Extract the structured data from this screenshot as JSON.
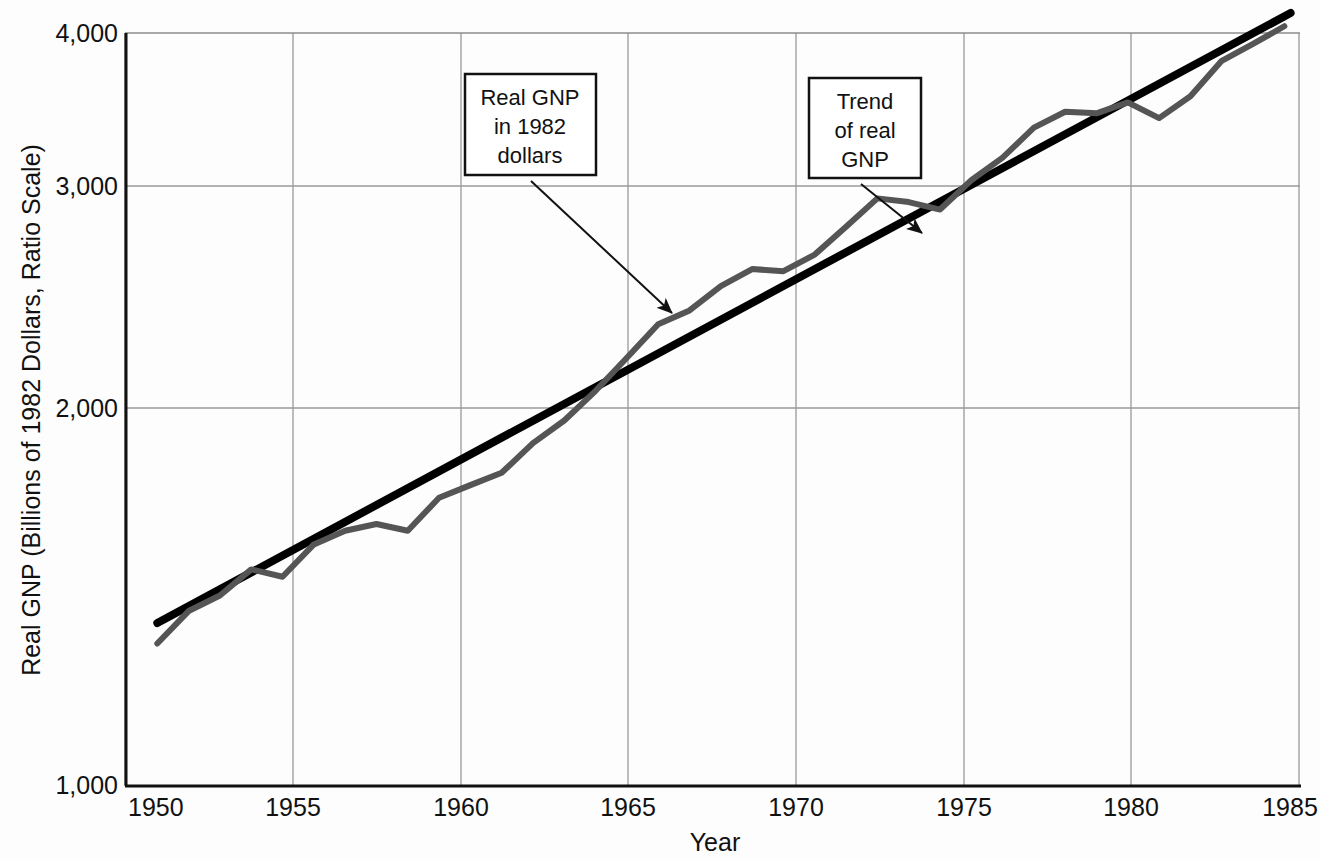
{
  "chart_data": {
    "type": "line",
    "title": "",
    "xlabel": "Year",
    "ylabel": "Real GNP (Billions of 1982 Dollars, Ratio Scale)",
    "scale": "log",
    "grid": true,
    "legend_position": "none",
    "xlim": [
      1949,
      1986.5
    ],
    "ylim": [
      1000,
      4000
    ],
    "yticks": [
      "1,000",
      "2,000",
      "3,000",
      "4,000"
    ],
    "ytick_values": [
      1000,
      2000,
      3000,
      4000
    ],
    "xticks": [
      "1950",
      "1955",
      "1960",
      "1965",
      "1970",
      "1975",
      "1980",
      "1985"
    ],
    "xtick_values": [
      1950,
      1955,
      1960,
      1965,
      1970,
      1975,
      1980,
      1985
    ],
    "series": [
      {
        "name": "Real GNP in 1982 dollars",
        "color": "#555555",
        "x": [
          1950,
          1951,
          1952,
          1953,
          1954,
          1955,
          1956,
          1957,
          1958,
          1959,
          1960,
          1961,
          1962,
          1963,
          1964,
          1965,
          1966,
          1967,
          1968,
          1969,
          1970,
          1971,
          1972,
          1973,
          1974,
          1975,
          1976,
          1977,
          1978,
          1979,
          1980,
          1981,
          1982,
          1983,
          1984,
          1985,
          1986
        ],
        "values": [
          1300,
          1380,
          1420,
          1490,
          1470,
          1560,
          1600,
          1620,
          1600,
          1700,
          1740,
          1780,
          1880,
          1960,
          2070,
          2200,
          2340,
          2400,
          2510,
          2590,
          2580,
          2660,
          2800,
          2950,
          2930,
          2890,
          3050,
          3180,
          3360,
          3460,
          3450,
          3520,
          3420,
          3560,
          3800,
          3920,
          4050
        ]
      },
      {
        "name": "Trend of real GNP",
        "color": "#000000",
        "x": [
          1950,
          1986.2
        ],
        "values": [
          1350,
          4150
        ]
      }
    ],
    "annotations": [
      {
        "id": "real-gnp-note",
        "lines": [
          "Real GNP",
          "in 1982",
          "dollars"
        ],
        "box": {
          "x": 465,
          "y": 74,
          "width": 131,
          "height": 101
        },
        "arrow": {
          "x1": 531,
          "y1": 181,
          "x2": 672,
          "y2": 313
        }
      },
      {
        "id": "trend-note",
        "lines": [
          "Trend",
          "of real",
          "GNP"
        ],
        "box": {
          "x": 809,
          "y": 78,
          "width": 112,
          "height": 100
        },
        "arrow": {
          "x1": 861,
          "y1": 184,
          "x2": 922,
          "y2": 233
        }
      }
    ]
  }
}
